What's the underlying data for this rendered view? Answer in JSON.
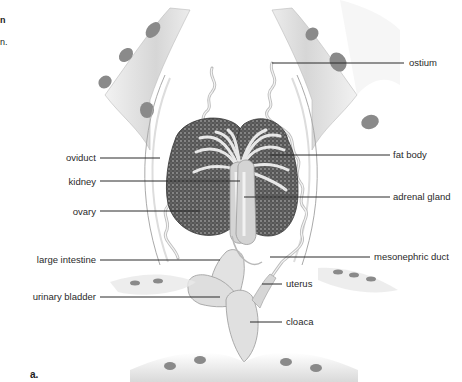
{
  "figure": {
    "panel_label": "a.",
    "edge_fragments": [
      "n",
      "n."
    ],
    "labels_left": [
      {
        "text": "oviduct",
        "y": 158
      },
      {
        "text": "kidney",
        "y": 182
      },
      {
        "text": "ovary",
        "y": 212
      },
      {
        "text": "large intestine",
        "y": 260
      },
      {
        "text": "urinary bladder",
        "y": 296
      }
    ],
    "labels_right": [
      {
        "text": "ostium",
        "y": 63
      },
      {
        "text": "fat body",
        "y": 155
      },
      {
        "text": "adrenal gland",
        "y": 197
      },
      {
        "text": "mesonephric duct",
        "y": 257
      },
      {
        "text": "uterus",
        "y": 284
      },
      {
        "text": "cloaca",
        "y": 322
      }
    ],
    "colors": {
      "leader_line": "#2a2a2a",
      "organ_dark": "#4a4a4a",
      "tissue_light": "#e4e4e4",
      "body_wall": "#d8d8d8",
      "label_text": "#2a2a2a"
    }
  }
}
